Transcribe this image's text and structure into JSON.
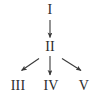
{
  "diagram": {
    "title": "",
    "background_color": "#ffffff",
    "stroke_color": "#3a3a3a",
    "text_color": "#2b2b2b",
    "nodes": [
      {
        "id": "I",
        "label": "I",
        "x": 50,
        "y": 11,
        "level": 0
      },
      {
        "id": "II",
        "label": "II",
        "x": 50,
        "y": 47,
        "level": 1
      },
      {
        "id": "III",
        "label": "III",
        "x": 18,
        "y": 87,
        "level": 2
      },
      {
        "id": "IV",
        "label": "IV",
        "x": 51,
        "y": 87,
        "level": 2
      },
      {
        "id": "V",
        "label": "V",
        "x": 84,
        "y": 87,
        "level": 2
      }
    ],
    "edges": [
      {
        "from": "I",
        "to": "II",
        "direction": "down",
        "arrowhead": true
      },
      {
        "from": "II",
        "to": "III",
        "direction": "down-left",
        "arrowhead": true
      },
      {
        "from": "II",
        "to": "IV",
        "direction": "down",
        "arrowhead": true
      },
      {
        "from": "II",
        "to": "V",
        "direction": "down-right",
        "arrowhead": true
      }
    ]
  }
}
